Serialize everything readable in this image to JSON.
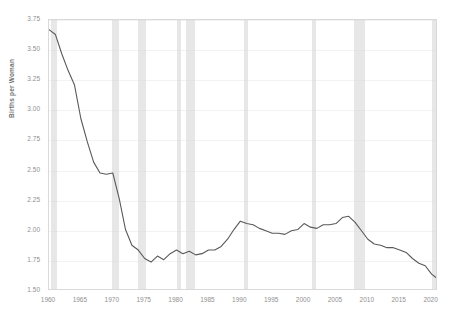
{
  "chart_data": {
    "type": "line",
    "title": "",
    "subtitle": "",
    "xlabel": "",
    "ylabel": "Births per Woman",
    "xlim": [
      1960,
      2021
    ],
    "ylim": [
      1.5,
      3.75
    ],
    "grid": true,
    "legend": "none",
    "y_ticks": [
      "1.50",
      "1.75",
      "2.00",
      "2.25",
      "2.50",
      "2.75",
      "3.00",
      "3.25",
      "3.50",
      "3.75"
    ],
    "x_ticks": [
      "1960",
      "1965",
      "1970",
      "1975",
      "1980",
      "1985",
      "1990",
      "1995",
      "2000",
      "2005",
      "2010",
      "2015",
      "2020"
    ],
    "series": [
      {
        "name": "Births per Woman",
        "color": "#595959",
        "x": [
          1960,
          1961,
          1962,
          1963,
          1964,
          1965,
          1966,
          1967,
          1968,
          1969,
          1970,
          1971,
          1972,
          1973,
          1974,
          1975,
          1976,
          1977,
          1978,
          1979,
          1980,
          1981,
          1982,
          1983,
          1984,
          1985,
          1986,
          1987,
          1988,
          1989,
          1990,
          1991,
          1992,
          1993,
          1994,
          1995,
          1996,
          1997,
          1998,
          1999,
          2000,
          2001,
          2002,
          2003,
          2004,
          2005,
          2006,
          2007,
          2008,
          2009,
          2010,
          2011,
          2012,
          2013,
          2014,
          2015,
          2016,
          2017,
          2018,
          2019,
          2020,
          2021
        ],
        "values": [
          3.67,
          3.63,
          3.47,
          3.33,
          3.21,
          2.93,
          2.74,
          2.57,
          2.48,
          2.47,
          2.48,
          2.27,
          2.01,
          1.88,
          1.84,
          1.77,
          1.74,
          1.79,
          1.76,
          1.81,
          1.84,
          1.81,
          1.83,
          1.8,
          1.81,
          1.84,
          1.84,
          1.87,
          1.93,
          2.01,
          2.08,
          2.06,
          2.05,
          2.02,
          2.0,
          1.98,
          1.98,
          1.97,
          2.0,
          2.01,
          2.06,
          2.03,
          2.02,
          2.05,
          2.05,
          2.06,
          2.11,
          2.12,
          2.07,
          2.0,
          1.93,
          1.89,
          1.88,
          1.86,
          1.86,
          1.84,
          1.82,
          1.77,
          1.73,
          1.71,
          1.64,
          1.6
        ]
      }
    ],
    "annotations": {
      "shaded_bands_label": "recession",
      "shaded_bands_color": "#d9d9d9",
      "recession_bands": [
        {
          "start": 1960.3,
          "end": 1961.2
        },
        {
          "start": 1969.9,
          "end": 1970.9
        },
        {
          "start": 1973.9,
          "end": 1975.2
        },
        {
          "start": 1980.1,
          "end": 1980.6
        },
        {
          "start": 1981.5,
          "end": 1982.9
        },
        {
          "start": 1990.6,
          "end": 1991.2
        },
        {
          "start": 2001.2,
          "end": 2001.9
        },
        {
          "start": 2007.9,
          "end": 2009.5
        },
        {
          "start": 2020.1,
          "end": 2020.5
        }
      ]
    }
  }
}
